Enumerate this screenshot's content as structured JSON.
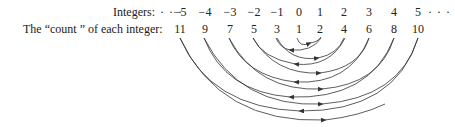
{
  "labels": {
    "integers": "Integers:",
    "count": "The “count ” of each integer:",
    "ellipsis_left": "· · ·",
    "ellipsis_right": "· · ·"
  },
  "integers": [
    "−5",
    "−4",
    "−3",
    "−2",
    "−1",
    "0",
    "1",
    "2",
    "3",
    "4",
    "5"
  ],
  "counts": [
    "11",
    "9",
    "7",
    "5",
    "3",
    "1",
    "2",
    "4",
    "6",
    "8",
    "10"
  ],
  "colors": {
    "stroke": "#333333",
    "text": "#222222"
  }
}
